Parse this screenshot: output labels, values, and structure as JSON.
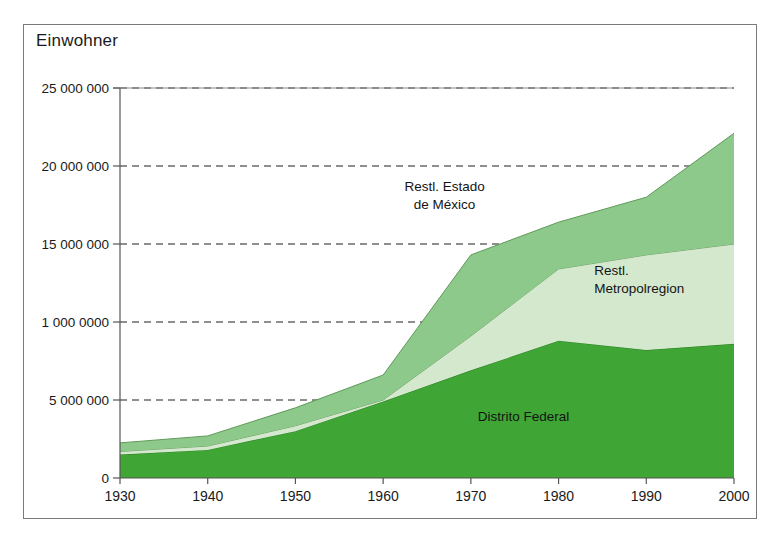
{
  "figure": {
    "axis_title": "Einwohner",
    "frame_color": "#7a7a7a",
    "background": "#ffffff"
  },
  "chart_data": {
    "type": "area",
    "stacked": true,
    "title": "Einwohner",
    "xlabel": "",
    "ylabel": "Einwohner",
    "grid": true,
    "grid_style": "dashed-horizontal",
    "legend": "inline-annotations",
    "xlim": [
      1930,
      2000
    ],
    "ylim": [
      0,
      25000000
    ],
    "x": [
      1930,
      1940,
      1950,
      1960,
      1970,
      1980,
      1990,
      2000
    ],
    "categories": [
      "1930",
      "1940",
      "1950",
      "1960",
      "1970",
      "1980",
      "1990",
      "2000"
    ],
    "xticks": [
      1930,
      1940,
      1950,
      1960,
      1970,
      1980,
      1990,
      2000
    ],
    "xtick_labels": [
      "1930",
      "1940",
      "1950",
      "1960",
      "1970",
      "1980",
      "1990",
      "2000"
    ],
    "yticks": [
      0,
      5000000,
      10000000,
      15000000,
      20000000,
      25000000
    ],
    "ytick_labels": [
      "0",
      "5 000 000",
      "1 000 0000",
      "15 000 000",
      "20 000 000",
      "25 000 000"
    ],
    "series": [
      {
        "name": "Distrito Federal",
        "color": "#3fa535",
        "edge_color": "#2d7f26",
        "values": [
          1500000,
          1800000,
          3000000,
          4900000,
          6900000,
          8800000,
          8200000,
          8600000
        ]
      },
      {
        "name": "Restl. Metropolregion",
        "color": "#d3e8cc",
        "edge_color": "#6f9e68",
        "values": [
          200000,
          250000,
          350000,
          100000,
          2200000,
          4600000,
          6100000,
          6400000
        ]
      },
      {
        "name": "Restl. Estado de México",
        "color": "#8cc98a",
        "edge_color": "#5e9a58",
        "values": [
          550000,
          650000,
          1150000,
          1600000,
          5200000,
          3000000,
          3700000,
          7100000
        ]
      }
    ],
    "cumulative_totals": [
      2250000,
      2700000,
      4500000,
      6600000,
      14300000,
      16400000,
      18000000,
      22100000
    ],
    "annotations": [
      {
        "text": "Restl. Estado\nde México",
        "x": 1967,
        "y": 18600000
      },
      {
        "text": "Restl.\nMetropolregion",
        "x": 1990,
        "y": 13200000
      },
      {
        "text": "Distrito Federal",
        "x": 1976,
        "y": 3900000
      }
    ]
  },
  "annotation_labels": {
    "upper_line1": "Restl. Estado",
    "upper_line2": "de México",
    "middle_line1": "Restl.",
    "middle_line2": "Metropolregion",
    "lower": "Distrito Federal"
  }
}
